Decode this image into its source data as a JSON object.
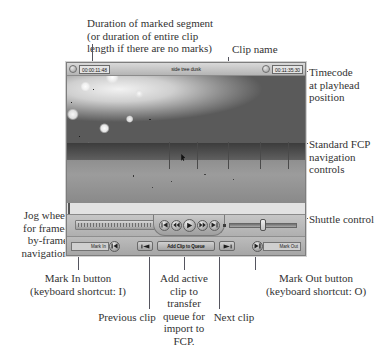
{
  "window": {
    "title_bar": {
      "duration_timecode": "00:00:11:48",
      "clip_name": "side tree dusk",
      "playhead_timecode": "00:11:35:30"
    },
    "video": {
      "description": "grayscale video frame of cherry blossom branches over a park field"
    },
    "transport": {
      "jog_wheel_name": "jog wheel",
      "shuttle_name": "shuttle control",
      "buttons": [
        {
          "name": "go-to-in-point",
          "icon": "skip-to-start-icon"
        },
        {
          "name": "step-back",
          "icon": "rewind-icon"
        },
        {
          "name": "play",
          "icon": "play-icon"
        },
        {
          "name": "step-forward",
          "icon": "fast-forward-icon"
        },
        {
          "name": "go-to-out-point",
          "icon": "skip-to-end-icon"
        }
      ]
    },
    "bottom_bar": {
      "mark_in_label": "Mark In",
      "mark_in_value": "Mark In",
      "mark_out_label": "Mark Out",
      "mark_out_value": "Mark Out",
      "previous_clip_label": "",
      "add_clip_label": "Add Clip to Queue",
      "next_clip_label": ""
    }
  },
  "annotations": {
    "duration": "Duration of marked segment\n(or duration of entire clip\nlength if there are no marks)",
    "clip_name": "Clip name",
    "timecode": "Timecode\nat playhead\nposition",
    "fcp_nav": "Standard FCP\nnavigation\ncontrols",
    "shuttle": "Shuttle control",
    "jog_wheel": "Jog wheel\nfor frame-\nby-frame\nnavigation",
    "mark_in": "Mark In button\n(keyboard shortcut: I)",
    "previous_clip": "Previous clip",
    "add_active_clip": "Add active\nclip to\ntransfer\nqueue for\nimport to\nFCP.",
    "next_clip": "Next clip",
    "mark_out": "Mark Out button\n(keyboard shortcut: O)"
  },
  "colors": {
    "page_background": "#ffffff",
    "window_chrome": "#b9b9b9",
    "leader_line": "#55555f",
    "annotation_text": "#333333"
  }
}
